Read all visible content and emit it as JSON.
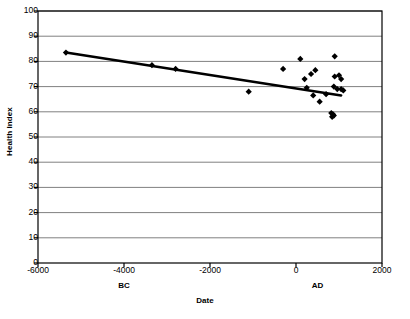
{
  "chart_data": {
    "type": "scatter",
    "title": "",
    "xlabel": "Date",
    "ylabel": "Health Index",
    "xlim": [
      -6000,
      2000
    ],
    "ylim": [
      0,
      100
    ],
    "xticks": [
      -6000,
      -4000,
      -2000,
      0,
      2000
    ],
    "xtick_labels": [
      "-6000",
      "-4000",
      "-2000",
      "0",
      "2000"
    ],
    "yticks": [
      0,
      10,
      20,
      30,
      40,
      50,
      60,
      70,
      80,
      90,
      100
    ],
    "ytick_labels": [
      "0",
      "10",
      "20",
      "30",
      "40",
      "50",
      "60",
      "70",
      "80",
      "90",
      "100"
    ],
    "grid": "horizontal",
    "legend": "none",
    "era_annotations": [
      {
        "label": "BC",
        "x": -4000
      },
      {
        "label": "AD",
        "x": 500
      }
    ],
    "marker": "diamond",
    "marker_color": "#000000",
    "trendline": {
      "label": "trend",
      "color": "#000000",
      "points": [
        [
          -5350,
          83.5
        ],
        [
          1050,
          66.5
        ]
      ]
    },
    "points": [
      {
        "x": -5350,
        "y": 83.5
      },
      {
        "x": -3350,
        "y": 78.5
      },
      {
        "x": -2800,
        "y": 77.0
      },
      {
        "x": -1100,
        "y": 68.0
      },
      {
        "x": -300,
        "y": 77.0
      },
      {
        "x": 100,
        "y": 81.0
      },
      {
        "x": 200,
        "y": 73.0
      },
      {
        "x": 350,
        "y": 75.0
      },
      {
        "x": 450,
        "y": 76.5
      },
      {
        "x": 250,
        "y": 69.5
      },
      {
        "x": 400,
        "y": 66.5
      },
      {
        "x": 550,
        "y": 64.0
      },
      {
        "x": 700,
        "y": 67.0
      },
      {
        "x": 900,
        "y": 82.0
      },
      {
        "x": 900,
        "y": 74.0
      },
      {
        "x": 1000,
        "y": 74.5
      },
      {
        "x": 1050,
        "y": 73.0
      },
      {
        "x": 880,
        "y": 70.0
      },
      {
        "x": 960,
        "y": 69.0
      },
      {
        "x": 1050,
        "y": 69.0
      },
      {
        "x": 1100,
        "y": 68.5
      },
      {
        "x": 820,
        "y": 59.5
      },
      {
        "x": 860,
        "y": 59.0
      },
      {
        "x": 880,
        "y": 58.5
      },
      {
        "x": 840,
        "y": 58.0
      }
    ]
  },
  "axis": {
    "frame_color": "#000000",
    "gridline_color": "#808080"
  }
}
